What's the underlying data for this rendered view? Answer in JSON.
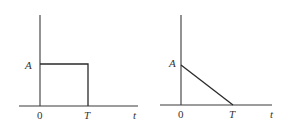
{
  "diagrams": [
    {
      "name": "rectangular-pulse",
      "amplitude_label": "A",
      "origin_label": "0",
      "end_label": "T",
      "axis_label": "t",
      "shape": "rectangular pulse of height A from t=0 to t=T"
    },
    {
      "name": "ramp-down-pulse",
      "amplitude_label": "A",
      "origin_label": "0",
      "end_label": "T",
      "axis_label": "t",
      "shape": "linear decrease from A at t=0 to 0 at t=T"
    }
  ]
}
